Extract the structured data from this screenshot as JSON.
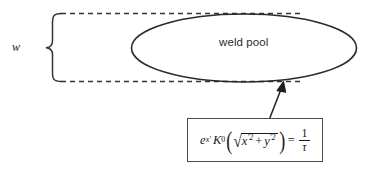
{
  "figure": {
    "type": "schematic-diagram",
    "background_color": "#ffffff",
    "line_color": "#333333",
    "labels": {
      "width_symbol": "w",
      "region_label": "weld pool"
    },
    "equation": {
      "base": "e",
      "base_exponent": "x′",
      "bessel_symbol": "K",
      "bessel_order": "0",
      "radicand_first": "x",
      "radicand_first_prime": "′",
      "radicand_first_power": "2",
      "plus": "+",
      "radicand_second": "y",
      "radicand_second_prime": "′",
      "radicand_second_power": "2",
      "equals": "=",
      "fraction_numerator": "1",
      "fraction_denominator": "τ",
      "plain_text": "e^{x'} K_0( sqrt(x'^2 + y'^2) ) = 1/τ"
    },
    "shapes": {
      "ellipse": {
        "cx": 244,
        "cy": 48,
        "rx": 112,
        "ry": 34,
        "stroke": "#2b2b2b"
      },
      "dashed_top_line": {
        "x1": 60,
        "y1": 14,
        "x2": 300,
        "y2": 14
      },
      "dashed_bottom_line": {
        "x1": 60,
        "y1": 82,
        "x2": 300,
        "y2": 82
      },
      "brace": {
        "x": 48,
        "y_top": 14,
        "y_bottom": 82
      },
      "arrow": {
        "from_x": 271,
        "from_y": 117,
        "to_x": 282,
        "to_y": 83
      },
      "equation_box": {
        "x": 187,
        "y": 118,
        "w": 136,
        "h": 44
      }
    }
  }
}
